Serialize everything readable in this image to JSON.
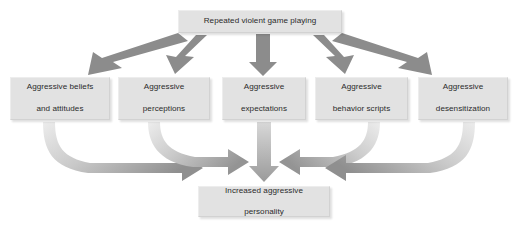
{
  "diagram": {
    "source_node": {
      "id": "repeated-violent-game-playing",
      "label": "Repeated violent game playing"
    },
    "mediators": [
      {
        "id": "aggressive-beliefs-and-attitudes",
        "line1": "Aggressive beliefs",
        "line2": "and attitudes"
      },
      {
        "id": "aggressive-perceptions",
        "line1": "Aggressive",
        "line2": "perceptions"
      },
      {
        "id": "aggressive-expectations",
        "line1": "Aggressive",
        "line2": "expectations"
      },
      {
        "id": "aggressive-behavior-scripts",
        "line1": "Aggressive",
        "line2": "behavior scripts"
      },
      {
        "id": "aggressive-desensitization",
        "line1": "Aggressive",
        "line2": "desensitization"
      }
    ],
    "outcome_node": {
      "id": "increased-aggressive-personality",
      "line1": "Increased aggressive",
      "line2": "personality"
    },
    "arrows": {
      "top_row": {
        "count": 5,
        "style": "straight-block-arrow",
        "color": "#8c8c8c",
        "direction": "source-to-mediators",
        "targets": [
          "aggressive-beliefs-and-attitudes",
          "aggressive-perceptions",
          "aggressive-expectations",
          "aggressive-behavior-scripts",
          "aggressive-desensitization"
        ]
      },
      "bottom_row": {
        "count": 5,
        "style": "curved-gradient-arrow",
        "color_light": "#e4e4e4",
        "color_dark": "#8f8f8f",
        "direction": "mediators-to-outcome",
        "sources": [
          "aggressive-beliefs-and-attitudes",
          "aggressive-perceptions",
          "aggressive-expectations",
          "aggressive-behavior-scripts",
          "aggressive-desensitization"
        ],
        "target": "increased-aggressive-personality"
      }
    },
    "colors": {
      "node_fill": "#e2e2e2",
      "node_border": "#d2d2d2",
      "text": "#2b2b2b",
      "arrow_solid": "#8c8c8c",
      "background": "#ffffff"
    }
  }
}
